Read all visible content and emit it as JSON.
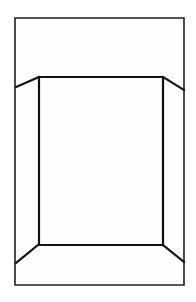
{
  "image": {
    "kind": "line-drawing",
    "subject": "trifold-display-board-perspective",
    "width": 196,
    "height": 302,
    "background_color": "#fefefe",
    "margin_color": "#ffffff",
    "ink_color": "#1a1a1a",
    "caption": "",
    "text_content": []
  },
  "geometry": {
    "outer_frame": {
      "name": "outer-sheet-rectangle",
      "left": 15,
      "top": 18,
      "right": 184,
      "bottom": 285,
      "stroke_width": 1.6,
      "color": "#1f1f1f",
      "points": "15,18 184,18 184,285 15,285 15,18"
    },
    "back_panel": {
      "name": "center-back-panel",
      "left": 39,
      "top": 77,
      "right": 163,
      "bottom": 245,
      "stroke_width": 2.2,
      "color": "#141414",
      "points": "39,77 163,77 163,245 39,245 39,77"
    },
    "wings": [
      {
        "name": "top-left-wing-edge",
        "from_x": 39,
        "from_y": 77,
        "to_x": 16,
        "to_y": 87,
        "stroke_width": 2.2,
        "color": "#141414"
      },
      {
        "name": "top-right-wing-edge",
        "from_x": 163,
        "from_y": 77,
        "to_x": 184,
        "to_y": 90,
        "stroke_width": 2.2,
        "color": "#141414"
      },
      {
        "name": "bottom-left-wing-edge",
        "from_x": 38,
        "from_y": 245,
        "to_x": 16,
        "to_y": 263,
        "stroke_width": 2.2,
        "color": "#141414"
      },
      {
        "name": "bottom-right-wing-edge",
        "from_x": 163,
        "from_y": 245,
        "to_x": 184,
        "to_y": 262,
        "stroke_width": 2.2,
        "color": "#141414"
      }
    ],
    "panels": [
      {
        "name": "left-side-wing-panel",
        "label": ""
      },
      {
        "name": "center-back-panel-face",
        "label": ""
      },
      {
        "name": "right-side-wing-panel",
        "label": ""
      }
    ]
  },
  "texture": {
    "specks": [
      {
        "x": 88,
        "y": 33,
        "size": 2,
        "opacity": 0.14
      },
      {
        "x": 125,
        "y": 50,
        "size": 1,
        "opacity": 0.12
      },
      {
        "x": 60,
        "y": 112,
        "size": 1,
        "opacity": 0.1
      },
      {
        "x": 146,
        "y": 160,
        "size": 2,
        "opacity": 0.1
      },
      {
        "x": 52,
        "y": 230,
        "size": 1,
        "opacity": 0.12
      },
      {
        "x": 110,
        "y": 268,
        "size": 1,
        "opacity": 0.1
      },
      {
        "x": 170,
        "y": 208,
        "size": 1,
        "opacity": 0.1
      },
      {
        "x": 30,
        "y": 186,
        "size": 1,
        "opacity": 0.1
      },
      {
        "x": 98,
        "y": 95,
        "size": 1,
        "opacity": 0.09
      },
      {
        "x": 75,
        "y": 252,
        "size": 2,
        "opacity": 0.1
      },
      {
        "x": 155,
        "y": 118,
        "size": 1,
        "opacity": 0.09
      },
      {
        "x": 45,
        "y": 60,
        "size": 1,
        "opacity": 0.1
      }
    ]
  }
}
